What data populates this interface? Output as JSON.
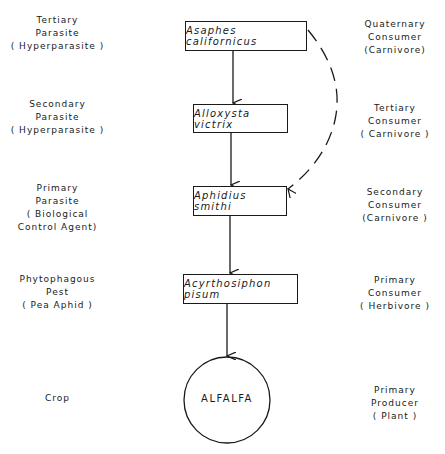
{
  "diagram": {
    "type": "food-chain",
    "nodes": [
      {
        "id": "asaphes",
        "label": "Asaphes californicus",
        "shape": "rectangle"
      },
      {
        "id": "alloxysta",
        "label": "Alloxysta victrix",
        "shape": "rectangle"
      },
      {
        "id": "aphidius",
        "label": "Aphidius smithi",
        "shape": "rectangle"
      },
      {
        "id": "acyrthosiphon",
        "label": "Acyrthosiphon pisum",
        "shape": "rectangle"
      },
      {
        "id": "alfalfa",
        "label": "ALFALFA",
        "shape": "circle"
      }
    ],
    "edges": [
      {
        "from": "asaphes",
        "to": "alloxysta",
        "style": "solid"
      },
      {
        "from": "alloxysta",
        "to": "aphidius",
        "style": "solid"
      },
      {
        "from": "asaphes",
        "to": "aphidius",
        "style": "dashed"
      },
      {
        "from": "aphidius",
        "to": "acyrthosiphon",
        "style": "solid"
      },
      {
        "from": "acyrthosiphon",
        "to": "alfalfa",
        "style": "solid"
      }
    ]
  },
  "left_labels": [
    {
      "lines": [
        "Tertiary",
        "Parasite",
        "( Hyperparasite )"
      ]
    },
    {
      "lines": [
        "Secondary",
        "Parasite",
        "( Hyperparasite )"
      ]
    },
    {
      "lines": [
        "Primary",
        "Parasite",
        "( Biological",
        "Control Agent)"
      ]
    },
    {
      "lines": [
        "Phytophagous",
        "Pest",
        "( Pea Aphid )"
      ]
    },
    {
      "lines": [
        "Crop"
      ]
    }
  ],
  "right_labels": [
    {
      "lines": [
        "Quaternary",
        "Consumer",
        "(Carnivore)"
      ]
    },
    {
      "lines": [
        "Tertiary",
        "Consumer",
        "( Carnivore )"
      ]
    },
    {
      "lines": [
        "Secondary",
        "Consumer",
        "(Carnivore )"
      ]
    },
    {
      "lines": [
        "Primary",
        "Consumer",
        "( Herbivore )"
      ]
    },
    {
      "lines": [
        "Primary",
        "Producer",
        "( Plant )"
      ]
    }
  ]
}
